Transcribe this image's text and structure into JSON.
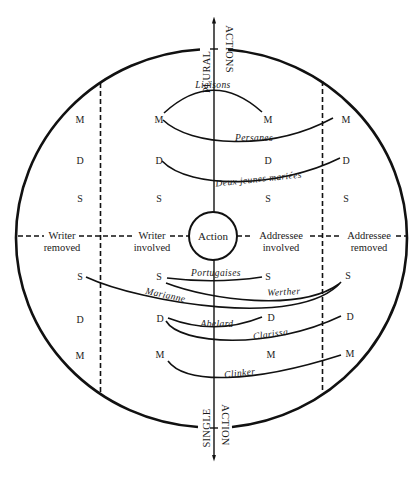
{
  "diagram": {
    "axis": {
      "top_label_left": "PLURAL",
      "top_label_right": "ACTIONS",
      "bottom_label_left": "SINGLE",
      "bottom_label_right": "ACTION"
    },
    "center_label": "Action",
    "columns": {
      "writer_removed_1": "Writer",
      "writer_removed_2": "removed",
      "writer_involved_1": "Writer",
      "writer_involved_2": "involved",
      "addressee_involved_1": "Addressee",
      "addressee_involved_2": "involved",
      "addressee_removed_1": "Addressee",
      "addressee_removed_2": "removed"
    },
    "rows_upper": [
      "M",
      "D",
      "S"
    ],
    "rows_lower": [
      "S",
      "D",
      "M"
    ],
    "nodes": {
      "m": "M",
      "d": "D",
      "s": "S"
    },
    "works": {
      "liaisons": "Liaisons",
      "persanes": "Persanes",
      "deux_jeunes_mariees": "Deux jeunes mariées",
      "portugaises": "Portugaises",
      "werther": "Werther",
      "marianne": "Marianne",
      "abelard": "Abelard",
      "clarissa": "Clarissa",
      "clinker": "Clinker"
    }
  }
}
